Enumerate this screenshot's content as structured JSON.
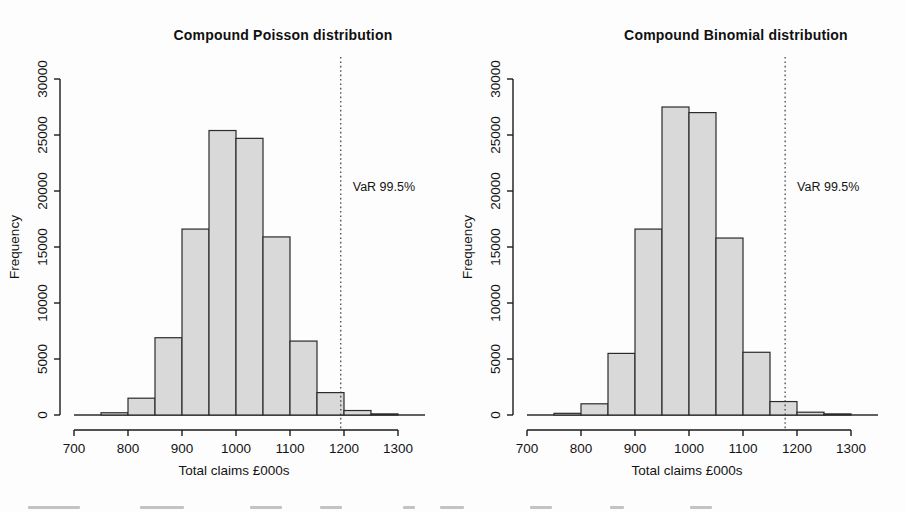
{
  "figure": {
    "background": "#fdfdfd",
    "text_color": "#141414",
    "axis_color": "#1a1a1a"
  },
  "chart_data": [
    {
      "type": "bar",
      "subtype": "histogram",
      "title": "Compound Poisson distribution",
      "xlabel": "Total claims £000s",
      "ylabel": "Frequency",
      "bin_start": 700,
      "bin_width": 50,
      "categories": [
        "700-750",
        "750-800",
        "800-850",
        "850-900",
        "900-950",
        "950-1000",
        "1000-1050",
        "1050-1100",
        "1100-1150",
        "1150-1200",
        "1200-1250",
        "1250-1300",
        "1300-1350"
      ],
      "values": [
        0,
        200,
        1500,
        6900,
        16600,
        25400,
        24700,
        15900,
        6600,
        2000,
        400,
        100,
        0
      ],
      "x_ticks": [
        700,
        800,
        900,
        1000,
        1100,
        1200,
        1300
      ],
      "y_ticks": [
        0,
        5000,
        10000,
        15000,
        20000,
        25000,
        30000
      ],
      "xlim": [
        700,
        1350
      ],
      "ylim": [
        0,
        30000
      ],
      "grid": "off",
      "var_line": {
        "x": 1194,
        "label": "VaR 99.5%",
        "style": "dotted"
      },
      "bar_fill": "#d9d9d9",
      "bar_stroke": "#2b2b2b",
      "var_color": "#3a3a3a"
    },
    {
      "type": "bar",
      "subtype": "histogram",
      "title": "Compound Binomial distribution",
      "xlabel": "Total claims £000s",
      "ylabel": "Frequency",
      "bin_start": 700,
      "bin_width": 50,
      "categories": [
        "700-750",
        "750-800",
        "800-850",
        "850-900",
        "900-950",
        "950-1000",
        "1000-1050",
        "1050-1100",
        "1100-1150",
        "1150-1200",
        "1200-1250",
        "1250-1300",
        "1300-1350"
      ],
      "values": [
        0,
        150,
        1000,
        5500,
        16600,
        27500,
        27000,
        15800,
        5600,
        1200,
        250,
        100,
        0
      ],
      "x_ticks": [
        700,
        800,
        900,
        1000,
        1100,
        1200,
        1300
      ],
      "y_ticks": [
        0,
        5000,
        10000,
        15000,
        20000,
        25000,
        30000
      ],
      "xlim": [
        700,
        1350
      ],
      "ylim": [
        0,
        30000
      ],
      "grid": "off",
      "var_line": {
        "x": 1178,
        "label": "VaR 99.5%",
        "style": "dotted"
      },
      "bar_fill": "#d9d9d9",
      "bar_stroke": "#2b2b2b",
      "var_color": "#3a3a3a"
    }
  ]
}
